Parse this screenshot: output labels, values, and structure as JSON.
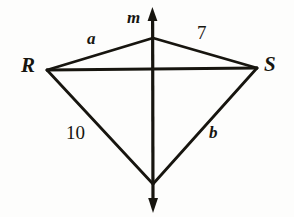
{
  "figure": {
    "type": "geometry-diagram",
    "background_color": "#fdfdfc",
    "stroke_color": "#17150f",
    "stroke_width": 2.6,
    "canvas": {
      "width": 294,
      "height": 217
    },
    "vertices": {
      "R": {
        "x": 47,
        "y": 70
      },
      "S": {
        "x": 257,
        "y": 68
      },
      "top": {
        "x": 153,
        "y": 38
      },
      "bottom": {
        "x": 153,
        "y": 184
      },
      "center": {
        "x": 153,
        "y": 69
      }
    },
    "line_m": {
      "name": "m",
      "arrow_top": {
        "x": 152,
        "y": 8
      },
      "arrow_bottom": {
        "x": 153,
        "y": 212
      },
      "orientation": "vertical",
      "double_headed": true
    },
    "edges": [
      {
        "name": "R-top",
        "from": "R",
        "to": "top",
        "label": "a"
      },
      {
        "name": "top-S",
        "from": "top",
        "to": "S",
        "label": "7"
      },
      {
        "name": "R-bottom",
        "from": "R",
        "to": "bottom",
        "label": "10"
      },
      {
        "name": "bottom-S",
        "from": "bottom",
        "to": "S",
        "label": "b"
      },
      {
        "name": "R-S",
        "from": "R",
        "to": "S",
        "label": ""
      }
    ],
    "labels": {
      "vertex_R": "R",
      "vertex_S": "S",
      "line_m": "m",
      "side_a": "a",
      "side_7": "7",
      "side_10": "10",
      "side_b": "b"
    }
  }
}
